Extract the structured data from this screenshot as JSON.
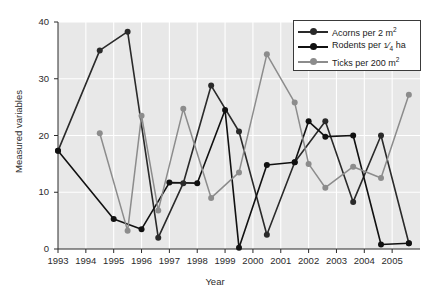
{
  "chart_data": {
    "type": "line",
    "title": "",
    "xlabel": "Year",
    "ylabel": "Measured variables",
    "xlim": [
      1993,
      2006
    ],
    "ylim": [
      0,
      40
    ],
    "yticks": [
      0,
      10,
      20,
      30,
      40
    ],
    "xticks": [
      1993,
      1994,
      1995,
      1996,
      1997,
      1998,
      1999,
      2000,
      2001,
      2002,
      2003,
      2004,
      2005
    ],
    "x": [
      1993.0,
      1994.5,
      1995.0,
      1995.5,
      1996.0,
      1996.6,
      1997.0,
      1997.5,
      1998.5,
      1999.0,
      1999.5,
      2000.5,
      2001.5,
      2002.0,
      2002.6,
      2003.6,
      2004.6,
      2005.6
    ],
    "grid": true,
    "grid_color": "#ffffff",
    "plot_background": "#e8e8e8",
    "legend_position": "top-right",
    "series": [
      {
        "name": "Acorns per 2 m²",
        "color": "#2a2a2a",
        "marker": "circle",
        "x": [
          1993.0,
          1994.5,
          1995.5,
          1996.6,
          1997.5,
          1998.5,
          1999.5,
          2000.5,
          2001.5,
          2002.6,
          2003.6,
          2004.6,
          2005.6
        ],
        "values": [
          17.3,
          35.0,
          38.3,
          2.0,
          11.6,
          28.8,
          20.7,
          2.5,
          15.3,
          22.5,
          8.3,
          20.0,
          1.0
        ]
      },
      {
        "name": "Rodents per 1/4 ha",
        "color": "#111111",
        "marker": "circle",
        "x": [
          1993.0,
          1995.0,
          1996.0,
          1997.0,
          1998.0,
          1999.0,
          1999.5,
          2000.5,
          2001.5,
          2002.0,
          2002.6,
          2003.6,
          2004.6,
          2005.6
        ],
        "values": [
          17.3,
          5.3,
          3.5,
          11.7,
          11.6,
          24.5,
          0.2,
          14.8,
          15.3,
          22.5,
          19.8,
          20.0,
          0.8,
          1.0
        ]
      },
      {
        "name": "Ticks per 200 m²",
        "color": "#8c8c8c",
        "marker": "circle",
        "x": [
          1994.5,
          1995.5,
          1996.0,
          1996.6,
          1997.5,
          1998.5,
          1999.5,
          2000.5,
          2001.5,
          2002.0,
          2002.6,
          2003.6,
          2004.6,
          2005.6
        ],
        "values": [
          20.4,
          3.2,
          23.5,
          6.8,
          24.7,
          9.0,
          13.5,
          34.3,
          25.8,
          15.0,
          10.8,
          14.5,
          12.5,
          27.2
        ]
      }
    ]
  },
  "legend": {
    "items": [
      {
        "label_prefix": "Acorns per 2 m",
        "sup": "2",
        "fraction": null,
        "label_suffix": ""
      },
      {
        "label_prefix": "Rodents per ",
        "sup": "",
        "fraction": {
          "num": "1",
          "den": "4"
        },
        "label_suffix": " ha"
      },
      {
        "label_prefix": "Ticks per 200 m",
        "sup": "2",
        "fraction": null,
        "label_suffix": ""
      }
    ]
  }
}
